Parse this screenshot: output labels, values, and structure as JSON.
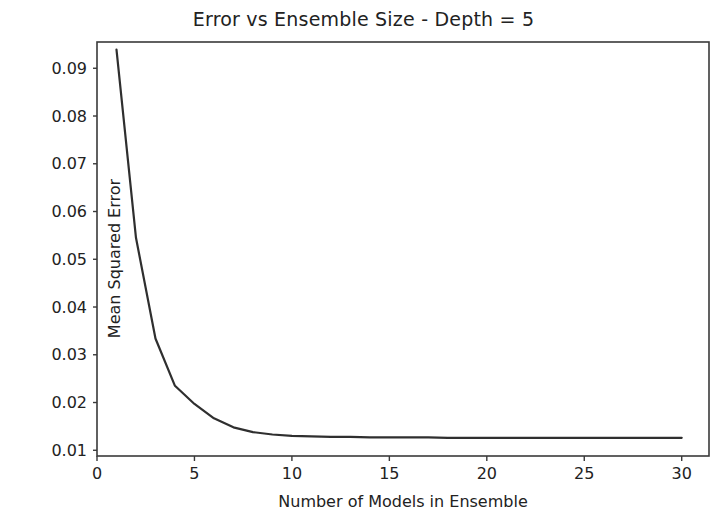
{
  "chart_data": {
    "type": "line",
    "title": "Error vs Ensemble Size - Depth = 5",
    "xlabel": "Number of Models in Ensemble",
    "ylabel": "Mean Squared Error",
    "grid": false,
    "legend": null,
    "line_color": "#2f2f2f",
    "axis_color": "#3a3a3a",
    "background_color": "#ffffff",
    "xlim": [
      0,
      31.4
    ],
    "ylim": [
      0.0088,
      0.0955
    ],
    "xticks": [
      0,
      5,
      10,
      15,
      20,
      25,
      30
    ],
    "xticklabels": [
      "0",
      "5",
      "10",
      "15",
      "20",
      "25",
      "30"
    ],
    "yticks": [
      0.01,
      0.02,
      0.03,
      0.04,
      0.05,
      0.06,
      0.07,
      0.08,
      0.09
    ],
    "yticklabels": [
      "0.01",
      "0.02",
      "0.03",
      "0.04",
      "0.05",
      "0.06",
      "0.07",
      "0.08",
      "0.09"
    ],
    "series": [
      {
        "name": "Mean Squared Error",
        "x": [
          1,
          2,
          3,
          4,
          5,
          6,
          7,
          8,
          9,
          10,
          11,
          12,
          13,
          14,
          15,
          16,
          17,
          18,
          19,
          20,
          21,
          22,
          23,
          24,
          25,
          26,
          27,
          28,
          29,
          30
        ],
        "values": [
          0.0939,
          0.0545,
          0.0334,
          0.0235,
          0.0197,
          0.0167,
          0.0148,
          0.0138,
          0.0133,
          0.013,
          0.0129,
          0.0128,
          0.0128,
          0.0127,
          0.0127,
          0.0127,
          0.0127,
          0.0126,
          0.0126,
          0.0126,
          0.0126,
          0.0126,
          0.0126,
          0.0126,
          0.0126,
          0.0126,
          0.0126,
          0.0126,
          0.0126,
          0.0126
        ]
      }
    ]
  },
  "figure": {
    "width": 727,
    "height": 526,
    "plot_area": {
      "left": 97,
      "top": 42,
      "right": 709,
      "bottom": 456
    }
  }
}
